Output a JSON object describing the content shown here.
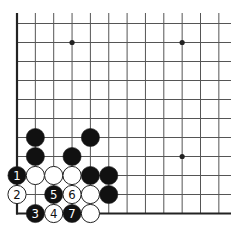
{
  "diagram": {
    "type": "go-board-partial",
    "grid": {
      "columns": 12,
      "rows": 11,
      "x0": 17,
      "dx": 18.35,
      "y0": 23.5,
      "dy": 19.0,
      "extend_top": 13,
      "extend_right": 231,
      "edges": [
        "left",
        "bottom"
      ]
    },
    "star_points": [
      {
        "col": 3,
        "row": 1
      },
      {
        "col": 9,
        "row": 1
      },
      {
        "col": 9,
        "row": 7
      }
    ],
    "stones": [
      {
        "col": 1,
        "row": 6,
        "color": "black",
        "label": ""
      },
      {
        "col": 4,
        "row": 6,
        "color": "black",
        "label": ""
      },
      {
        "col": 1,
        "row": 7,
        "color": "black",
        "label": ""
      },
      {
        "col": 3,
        "row": 7,
        "color": "black",
        "label": ""
      },
      {
        "col": 0,
        "row": 8,
        "color": "black",
        "label": "1"
      },
      {
        "col": 1,
        "row": 8,
        "color": "white",
        "label": ""
      },
      {
        "col": 2,
        "row": 8,
        "color": "white",
        "label": ""
      },
      {
        "col": 3,
        "row": 8,
        "color": "white",
        "label": ""
      },
      {
        "col": 4,
        "row": 8,
        "color": "black",
        "label": ""
      },
      {
        "col": 5,
        "row": 8,
        "color": "black",
        "label": ""
      },
      {
        "col": 0,
        "row": 9,
        "color": "white",
        "label": "2"
      },
      {
        "col": 2,
        "row": 9,
        "color": "black",
        "label": "5"
      },
      {
        "col": 3,
        "row": 9,
        "color": "white",
        "label": "6"
      },
      {
        "col": 4,
        "row": 9,
        "color": "white",
        "label": ""
      },
      {
        "col": 5,
        "row": 9,
        "color": "black",
        "label": ""
      },
      {
        "col": 1,
        "row": 10,
        "color": "black",
        "label": "3"
      },
      {
        "col": 2,
        "row": 10,
        "color": "white",
        "label": "4"
      },
      {
        "col": 3,
        "row": 10,
        "color": "black",
        "label": "7"
      },
      {
        "col": 4,
        "row": 10,
        "color": "white",
        "label": ""
      }
    ],
    "colors": {
      "background": "#ffffff",
      "line": "#555555",
      "edge": "#222222",
      "black_stone": "#111111",
      "white_stone": "#ffffff",
      "stone_outline": "#222222"
    }
  }
}
